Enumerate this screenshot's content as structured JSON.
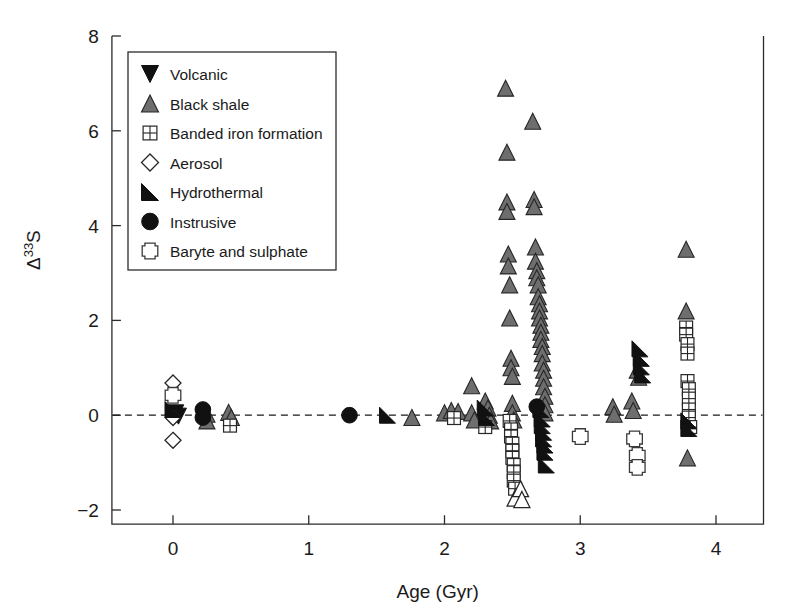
{
  "chart_data": {
    "type": "scatter",
    "title": "",
    "xlabel": "Age (Gyr)",
    "ylabel": "Δ33S",
    "ylabel_parts": {
      "delta": "Δ",
      "superscript": "33",
      "element": "S"
    },
    "xlim": [
      -0.45,
      4.35
    ],
    "ylim": [
      -2.3,
      8.0
    ],
    "xticks": [
      0,
      1,
      2,
      3,
      4
    ],
    "xticklabels": [
      "0",
      "1",
      "2",
      "3",
      "4"
    ],
    "yticks": [
      -2,
      0,
      2,
      4,
      6,
      8
    ],
    "yticklabels": [
      "−2",
      "0",
      "2",
      "4",
      "6",
      "8"
    ],
    "grid": false,
    "reference_line": {
      "y": 0,
      "style": "dashed"
    },
    "legend_position": "top-left",
    "series": [
      {
        "name": "Volcanic",
        "marker": "triangle-down",
        "color": "#111111",
        "points": [
          [
            0.02,
            0.05
          ],
          [
            0.04,
            -0.02
          ]
        ]
      },
      {
        "name": "Black shale",
        "marker": "triangle-up",
        "color": "#6e6e6e",
        "points": [
          [
            0.25,
            0.02
          ],
          [
            0.25,
            -0.12
          ],
          [
            0.41,
            0.06
          ],
          [
            0.43,
            -0.05
          ],
          [
            1.76,
            -0.05
          ],
          [
            2.0,
            0.05
          ],
          [
            2.05,
            0.1
          ],
          [
            2.1,
            0.08
          ],
          [
            2.2,
            0.62
          ],
          [
            2.2,
            0.05
          ],
          [
            2.22,
            -0.1
          ],
          [
            2.3,
            0.3
          ],
          [
            2.32,
            0.15
          ],
          [
            2.33,
            0.0
          ],
          [
            2.34,
            -0.12
          ],
          [
            2.45,
            6.9
          ],
          [
            2.46,
            5.55
          ],
          [
            2.46,
            4.5
          ],
          [
            2.46,
            4.3
          ],
          [
            2.47,
            3.4
          ],
          [
            2.47,
            3.15
          ],
          [
            2.48,
            2.75
          ],
          [
            2.48,
            2.05
          ],
          [
            2.49,
            1.2
          ],
          [
            2.49,
            1.0
          ],
          [
            2.5,
            0.82
          ],
          [
            2.5,
            0.25
          ],
          [
            2.5,
            0.05
          ],
          [
            2.51,
            -0.1
          ],
          [
            2.65,
            6.2
          ],
          [
            2.66,
            4.55
          ],
          [
            2.66,
            4.4
          ],
          [
            2.67,
            3.55
          ],
          [
            2.67,
            3.25
          ],
          [
            2.68,
            3.05
          ],
          [
            2.68,
            2.9
          ],
          [
            2.69,
            2.75
          ],
          [
            2.69,
            2.5
          ],
          [
            2.7,
            2.35
          ],
          [
            2.7,
            2.2
          ],
          [
            2.7,
            2.05
          ],
          [
            2.71,
            1.9
          ],
          [
            2.71,
            1.75
          ],
          [
            2.71,
            1.6
          ],
          [
            2.72,
            1.45
          ],
          [
            2.72,
            1.3
          ],
          [
            2.72,
            1.1
          ],
          [
            2.73,
            0.95
          ],
          [
            2.73,
            0.78
          ],
          [
            2.73,
            0.6
          ],
          [
            2.74,
            0.4
          ],
          [
            2.74,
            0.22
          ],
          [
            2.74,
            0.05
          ],
          [
            3.24,
            0.18
          ],
          [
            3.25,
            0.02
          ],
          [
            3.38,
            0.3
          ],
          [
            3.39,
            0.1
          ],
          [
            3.42,
            0.95
          ],
          [
            3.43,
            0.8
          ],
          [
            3.78,
            3.5
          ],
          [
            3.78,
            2.2
          ],
          [
            3.79,
            -0.9
          ]
        ]
      },
      {
        "name": "Banded iron formation",
        "marker": "square-grid",
        "color": "#ffffff",
        "points": [
          [
            0.42,
            -0.22
          ],
          [
            2.07,
            -0.06
          ],
          [
            2.3,
            -0.25
          ],
          [
            2.48,
            -0.12
          ],
          [
            2.49,
            -0.3
          ],
          [
            2.49,
            -0.45
          ],
          [
            2.5,
            -0.6
          ],
          [
            2.5,
            -0.75
          ],
          [
            2.5,
            -0.9
          ],
          [
            2.51,
            -1.05
          ],
          [
            2.51,
            -1.2
          ],
          [
            2.51,
            -1.38
          ],
          [
            2.52,
            -1.55
          ],
          [
            3.78,
            1.85
          ],
          [
            3.78,
            1.7
          ],
          [
            3.79,
            1.5
          ],
          [
            3.79,
            1.3
          ],
          [
            3.79,
            0.72
          ],
          [
            3.8,
            0.55
          ],
          [
            3.8,
            0.35
          ],
          [
            3.8,
            0.12
          ],
          [
            3.8,
            -0.05
          ],
          [
            3.81,
            -0.25
          ]
        ]
      },
      {
        "name": "Aerosol",
        "marker": "diamond",
        "color": "#ffffff",
        "points": [
          [
            0.0,
            0.68
          ],
          [
            0.0,
            -0.05
          ],
          [
            0.0,
            -0.53
          ]
        ]
      },
      {
        "name": "Hydrothermal",
        "marker": "right-triangle",
        "color": "#111111",
        "points": [
          [
            0.0,
            0.12
          ],
          [
            1.58,
            0.0
          ],
          [
            2.3,
            0.15
          ],
          [
            2.31,
            -0.05
          ],
          [
            2.71,
            0.12
          ],
          [
            2.72,
            -0.08
          ],
          [
            2.72,
            -0.22
          ],
          [
            2.73,
            -0.36
          ],
          [
            2.73,
            -0.5
          ],
          [
            2.74,
            -0.63
          ],
          [
            2.74,
            -0.78
          ],
          [
            2.75,
            -1.05
          ],
          [
            3.44,
            1.4
          ],
          [
            3.45,
            1.2
          ],
          [
            3.45,
            1.02
          ],
          [
            3.46,
            0.85
          ],
          [
            3.8,
            -0.12
          ],
          [
            3.8,
            -0.28
          ]
        ]
      },
      {
        "name": "Instrusive",
        "marker": "circle",
        "color": "#111111",
        "points": [
          [
            0.22,
            0.12
          ],
          [
            0.22,
            -0.05
          ],
          [
            1.3,
            0.0
          ],
          [
            2.68,
            0.18
          ]
        ]
      },
      {
        "name": "Baryte and sulphate",
        "marker": "cross",
        "color": "#ffffff",
        "points": [
          [
            0.0,
            0.42
          ],
          [
            3.0,
            -0.45
          ],
          [
            3.4,
            -0.5
          ],
          [
            3.42,
            -0.85
          ],
          [
            3.42,
            -1.1
          ]
        ]
      },
      {
        "name": "Open triangle",
        "marker": "triangle-open",
        "color": "#ffffff",
        "points": [
          [
            2.52,
            -1.75
          ],
          [
            2.56,
            -1.55
          ],
          [
            2.57,
            -1.78
          ]
        ]
      }
    ]
  },
  "legend": {
    "entries": [
      {
        "label": "Volcanic",
        "marker": "triangle-down"
      },
      {
        "label": "Black shale",
        "marker": "triangle-up"
      },
      {
        "label": "Banded iron formation",
        "marker": "square-grid"
      },
      {
        "label": "Aerosol",
        "marker": "diamond"
      },
      {
        "label": "Hydrothermal",
        "marker": "right-triangle"
      },
      {
        "label": "Instrusive",
        "marker": "circle"
      },
      {
        "label": "Baryte and sulphate",
        "marker": "cross"
      }
    ]
  },
  "colors": {
    "grey_marker": "#6e6e6e",
    "black_marker": "#111111",
    "outline": "#262626",
    "background": "#ffffff"
  }
}
